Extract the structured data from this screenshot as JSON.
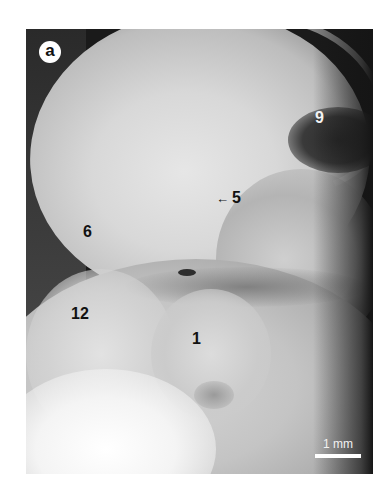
{
  "figure": {
    "panel_label": "a",
    "labels": {
      "label_9": "9",
      "label_5": "5",
      "arrow_5": "←",
      "label_6": "6",
      "label_12": "12",
      "label_1": "1"
    },
    "scale_bar": {
      "text": "1 mm"
    }
  }
}
